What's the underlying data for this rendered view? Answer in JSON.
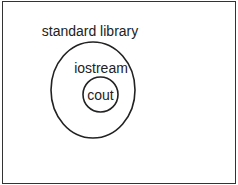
{
  "diagram": {
    "type": "nested-sets",
    "sets": [
      {
        "label": "standard library",
        "shape": "ellipse",
        "contains": [
          "iostream"
        ]
      },
      {
        "label": "iostream",
        "shape": "region",
        "contains": [
          "cout"
        ]
      },
      {
        "label": "cout",
        "shape": "circle",
        "contains": []
      }
    ]
  },
  "labels": {
    "outer": "standard library",
    "middle": "iostream",
    "inner": "cout"
  },
  "colors": {
    "stroke": "#222222",
    "background": "#ffffff",
    "border": "#333333"
  }
}
